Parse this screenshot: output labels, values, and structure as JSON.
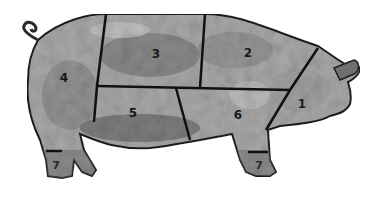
{
  "diagram": {
    "type": "pork-cuts-illustration",
    "colors": {
      "background": "#ffffff",
      "outline": "#1a1a1a",
      "body_light": "#b8b8b8",
      "body_mid": "#8f8f8f",
      "body_dark": "#6e6e6e"
    },
    "cuts": [
      {
        "id": "1",
        "label": "1",
        "x": 302,
        "y": 104
      },
      {
        "id": "2",
        "label": "2",
        "x": 248,
        "y": 53
      },
      {
        "id": "3",
        "label": "3",
        "x": 156,
        "y": 54
      },
      {
        "id": "4",
        "label": "4",
        "x": 64,
        "y": 78
      },
      {
        "id": "5",
        "label": "5",
        "x": 133,
        "y": 113
      },
      {
        "id": "6",
        "label": "6",
        "x": 238,
        "y": 115
      },
      {
        "id": "7a",
        "label": "7",
        "x": 56,
        "y": 166
      },
      {
        "id": "7b",
        "label": "7",
        "x": 259,
        "y": 166
      }
    ]
  }
}
